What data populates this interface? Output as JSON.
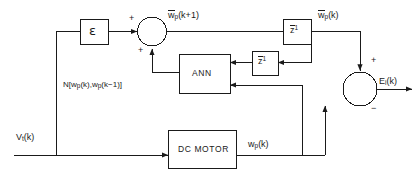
{
  "diagram": {
    "type": "control-block-diagram",
    "stroke_color": "#1a1a1a",
    "background": "#ffffff"
  },
  "blocks": {
    "epsilon": {
      "label": "ε",
      "name": "epsilon-gain-block"
    },
    "ann": {
      "label": "ANN",
      "name": "ann-block"
    },
    "delay_top": {
      "base": "z",
      "exponent": "1",
      "name": "unit-delay-top"
    },
    "delay_mid": {
      "base": "z",
      "exponent": "1",
      "name": "unit-delay-middle"
    },
    "dc_motor": {
      "label": "DC  MOTOR",
      "name": "dc-motor-block"
    }
  },
  "junctions": {
    "left_sum": {
      "name": "left-summing-junction",
      "sign_top": "+",
      "sign_bottom": "+"
    },
    "right_sum": {
      "name": "error-summing-junction",
      "sign_top": "+",
      "sign_bottom": "−"
    }
  },
  "signals": {
    "w_hat_k_plus_1": {
      "base": "w",
      "sub": "p",
      "arg": "(k+1)",
      "accent": "hat",
      "text": "ŵp(k+1)"
    },
    "w_hat_k": {
      "base": "w",
      "sub": "p",
      "arg": "(k)",
      "accent": "hat",
      "text": "ŵp(k)"
    },
    "ann_output": {
      "text": "N[wp(k),wp(k−1)]",
      "prefix": "N[w",
      "sub1": "p",
      "mid": "(k),w",
      "sub2": "p",
      "suffix": "(k−1)]"
    },
    "v_input": {
      "base": "V",
      "sub": "t",
      "arg": "(k)",
      "text": "Vt(k)"
    },
    "w_plant": {
      "base": "w",
      "sub": "p",
      "arg": "(k)",
      "text": "wp(k)"
    },
    "error": {
      "base": "E",
      "sub": "i",
      "arg": "(k)",
      "text": "Ei(k)"
    }
  }
}
